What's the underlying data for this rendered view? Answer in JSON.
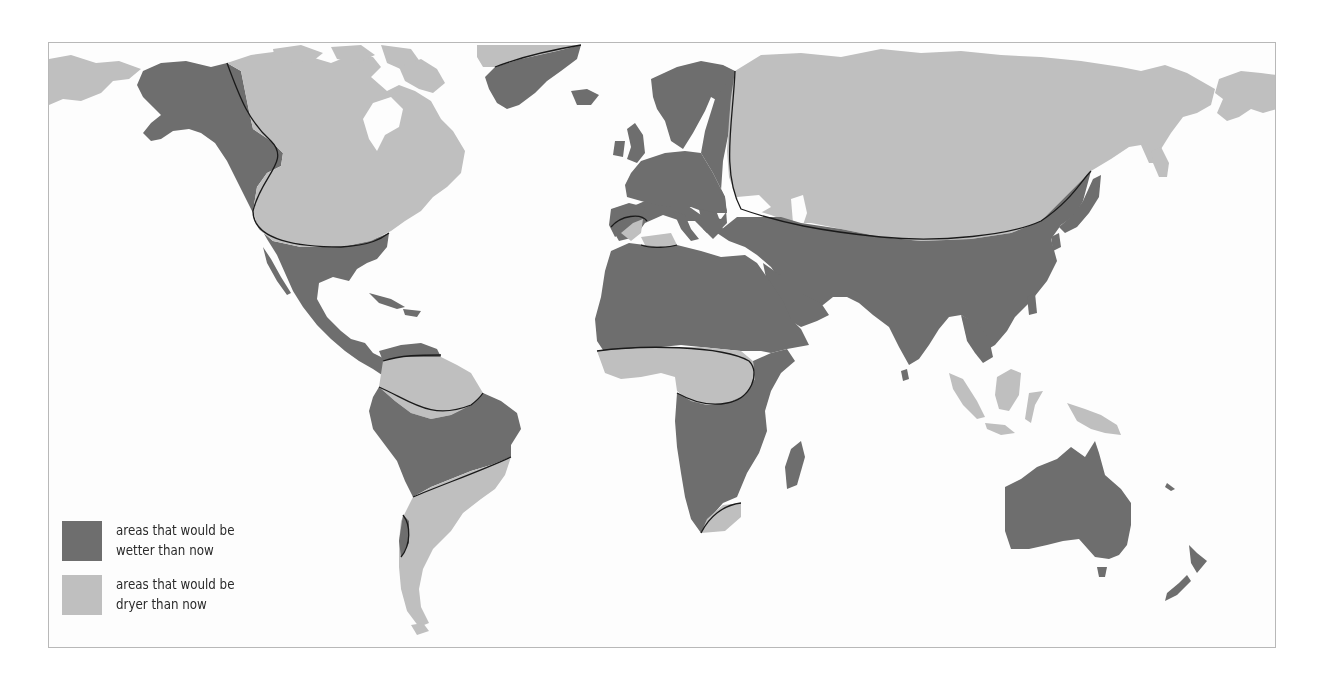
{
  "map": {
    "title": "",
    "type": "thematic world map",
    "colors": {
      "wetter": "#6e6e6e",
      "dryer": "#bfbfbf",
      "ocean": "#fdfdfd",
      "boundary_line": "#1a1a1a",
      "frame": "#b8b8b8"
    },
    "regions": [
      {
        "name": "Alaska / western North America",
        "category": "wetter"
      },
      {
        "name": "Canada / northern USA",
        "category": "dryer"
      },
      {
        "name": "Southern USA / Mexico / Central America",
        "category": "wetter"
      },
      {
        "name": "Greenland (north tip)",
        "category": "dryer"
      },
      {
        "name": "Greenland (south)",
        "category": "wetter"
      },
      {
        "name": "Europe / Scandinavia",
        "category": "wetter"
      },
      {
        "name": "Iberia / Maghreb coast",
        "category": "dryer"
      },
      {
        "name": "Russia / Siberia / Central Asia",
        "category": "dryer"
      },
      {
        "name": "Middle East / South & East Asia / China / Japan",
        "category": "wetter"
      },
      {
        "name": "North Africa / Sahara",
        "category": "wetter"
      },
      {
        "name": "West & Central Africa (Sahel band)",
        "category": "dryer"
      },
      {
        "name": "East & Southern Africa",
        "category": "wetter"
      },
      {
        "name": "South-eastern tip of Africa",
        "category": "dryer"
      },
      {
        "name": "Madagascar",
        "category": "wetter"
      },
      {
        "name": "Northern South America (Venezuela coast)",
        "category": "wetter"
      },
      {
        "name": "Amazon north",
        "category": "dryer"
      },
      {
        "name": "Central South America / Brazil",
        "category": "wetter"
      },
      {
        "name": "Southern South America",
        "category": "dryer"
      },
      {
        "name": "Central Chile strip",
        "category": "wetter"
      },
      {
        "name": "Indonesia / Borneo / New Guinea",
        "category": "dryer"
      },
      {
        "name": "Australia",
        "category": "wetter"
      },
      {
        "name": "New Zealand",
        "category": "wetter"
      },
      {
        "name": "Far-east Siberia / Chukotka",
        "category": "dryer"
      }
    ]
  },
  "legend": {
    "items": [
      {
        "key": "wetter",
        "line1": "areas that would be",
        "line2": "wetter than now"
      },
      {
        "key": "dryer",
        "line1": "areas that would be",
        "line2": "dryer than now"
      }
    ]
  }
}
